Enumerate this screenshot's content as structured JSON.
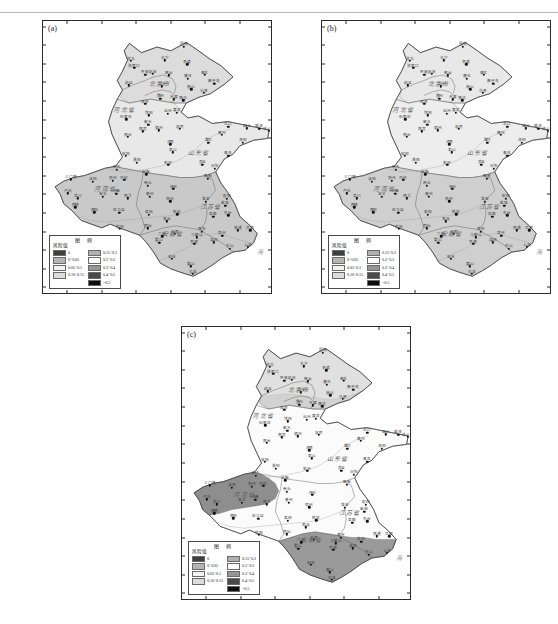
{
  "figure": {
    "caption_rule_text": "",
    "panels": [
      {
        "tag": "(a)",
        "id": "panel-a"
      },
      {
        "tag": "(b)",
        "id": "panel-b"
      },
      {
        "tag": "(c)",
        "id": "panel-c"
      }
    ]
  },
  "axes": {
    "y_ticks": [
      "43° N",
      "42°",
      "41°",
      "40°",
      "39°",
      "38°",
      "37°",
      "36°",
      "35°",
      "34°",
      "33°",
      "32°",
      "31°",
      "30°",
      "29°"
    ],
    "y_values": [
      43,
      42,
      41,
      40,
      39,
      38,
      37,
      36,
      35,
      34,
      33,
      32,
      31,
      30,
      29
    ],
    "x_ticks": [
      "111°",
      "113°",
      "115°",
      "117°",
      "119°",
      "121° E"
    ],
    "x_values": [
      111,
      113,
      115,
      117,
      119,
      121
    ],
    "x_range": [
      109.6,
      122.8
    ],
    "y_range": [
      28.7,
      43.3
    ],
    "x_label": "",
    "y_label": ""
  },
  "legend": {
    "title": "图  例",
    "subtitle": "风险值",
    "left_column": [
      {
        "label": "0",
        "color": "#3f3f3f"
      },
      {
        "label": "0~0.05",
        "color": "#b4b4b4"
      },
      {
        "label": "0.05~0.1",
        "color": "#f2f2f2"
      },
      {
        "label": "0.10~0.15",
        "color": "#dcdcdc"
      }
    ],
    "right_column": [
      {
        "label": "0.15~0.2",
        "color": "#b0b0b0"
      },
      {
        "label": "0.2~0.3",
        "color": "#fbfbfb"
      },
      {
        "label": "0.3~0.4",
        "color": "#969696"
      },
      {
        "label": "0.4~0.5",
        "color": "#4a4a4a"
      },
      {
        "label": ">0.5",
        "color": "#0d0d0d"
      }
    ]
  },
  "map": {
    "province_labels": [
      {
        "name": "北京市",
        "lon": 116.35,
        "lat": 39.95
      },
      {
        "name": "河北省",
        "lon": 114.3,
        "lat": 38.55
      },
      {
        "name": "山东省",
        "lon": 118.6,
        "lat": 36.25
      },
      {
        "name": "河南省",
        "lon": 113.2,
        "lat": 34.35
      },
      {
        "name": "江苏省",
        "lon": 119.3,
        "lat": 33.35
      },
      {
        "name": "安徽省",
        "lon": 117.1,
        "lat": 31.9
      }
    ],
    "sea_label": {
      "name": "海",
      "lon": 122.15,
      "lat": 30.95
    },
    "stations": [
      {
        "name": "张北",
        "lon": 114.7,
        "lat": 41.15
      },
      {
        "name": "张家口",
        "lon": 114.88,
        "lat": 40.78
      },
      {
        "name": "丰宁",
        "lon": 116.65,
        "lat": 41.2
      },
      {
        "name": "围场",
        "lon": 117.75,
        "lat": 41.93
      },
      {
        "name": "承德",
        "lon": 117.95,
        "lat": 40.98
      },
      {
        "name": "怀来",
        "lon": 115.52,
        "lat": 40.42
      },
      {
        "name": "蔚县",
        "lon": 114.57,
        "lat": 39.85
      },
      {
        "name": "延庆",
        "lon": 115.97,
        "lat": 40.45
      },
      {
        "name": "密云",
        "lon": 116.87,
        "lat": 40.38
      },
      {
        "name": "遵化",
        "lon": 117.97,
        "lat": 40.2
      },
      {
        "name": "青龙",
        "lon": 118.95,
        "lat": 40.4
      },
      {
        "name": "秦皇岛",
        "lon": 119.52,
        "lat": 39.93
      },
      {
        "name": "唐山",
        "lon": 118.18,
        "lat": 39.63
      },
      {
        "name": "乐亭",
        "lon": 118.9,
        "lat": 39.43
      },
      {
        "name": "北京",
        "lon": 116.47,
        "lat": 39.8
      },
      {
        "name": "天津",
        "lon": 117.17,
        "lat": 39.1
      },
      {
        "name": "保定",
        "lon": 115.52,
        "lat": 38.85
      },
      {
        "name": "霸州",
        "lon": 116.4,
        "lat": 39.12
      },
      {
        "name": "塘沽",
        "lon": 117.72,
        "lat": 39.05
      },
      {
        "name": "石家庄",
        "lon": 114.42,
        "lat": 38.03
      },
      {
        "name": "饶阳",
        "lon": 115.73,
        "lat": 38.23
      },
      {
        "name": "黄骅",
        "lon": 117.35,
        "lat": 38.37
      },
      {
        "name": "沧州",
        "lon": 116.83,
        "lat": 38.33
      },
      {
        "name": "南宫",
        "lon": 115.38,
        "lat": 37.37
      },
      {
        "name": "邢台",
        "lon": 114.5,
        "lat": 37.07
      },
      {
        "name": "衡水",
        "lon": 115.7,
        "lat": 37.73
      },
      {
        "name": "德州",
        "lon": 116.32,
        "lat": 37.43
      },
      {
        "name": "惠民",
        "lon": 117.53,
        "lat": 37.5
      },
      {
        "name": "龙口",
        "lon": 120.33,
        "lat": 37.62
      },
      {
        "name": "烟台",
        "lon": 121.4,
        "lat": 37.53
      },
      {
        "name": "威海",
        "lon": 122.12,
        "lat": 37.52
      },
      {
        "name": "成山头",
        "lon": 122.68,
        "lat": 37.4
      },
      {
        "name": "莱州",
        "lon": 119.95,
        "lat": 37.18
      },
      {
        "name": "潍坊",
        "lon": 119.18,
        "lat": 36.77
      },
      {
        "name": "青岛",
        "lon": 120.33,
        "lat": 36.07
      },
      {
        "name": "海阳",
        "lon": 121.17,
        "lat": 36.77
      },
      {
        "name": "济南",
        "lon": 116.98,
        "lat": 36.68
      },
      {
        "name": "泰山",
        "lon": 117.1,
        "lat": 36.25
      },
      {
        "name": "兖州",
        "lon": 116.85,
        "lat": 35.57
      },
      {
        "name": "莒县",
        "lon": 118.83,
        "lat": 35.58
      },
      {
        "name": "日照",
        "lon": 119.53,
        "lat": 35.38
      },
      {
        "name": "定陶",
        "lon": 115.57,
        "lat": 35.07
      },
      {
        "name": "安阳",
        "lon": 114.4,
        "lat": 36.05
      },
      {
        "name": "濮阳",
        "lon": 115.03,
        "lat": 35.7
      },
      {
        "name": "新乡",
        "lon": 113.88,
        "lat": 35.32
      },
      {
        "name": "三门峡",
        "lon": 111.2,
        "lat": 34.8
      },
      {
        "name": "洛阳",
        "lon": 112.47,
        "lat": 34.67
      },
      {
        "name": "郑州",
        "lon": 113.65,
        "lat": 34.72
      },
      {
        "name": "开封",
        "lon": 114.3,
        "lat": 34.77
      },
      {
        "name": "商丘",
        "lon": 115.67,
        "lat": 34.45
      },
      {
        "name": "卢氏",
        "lon": 111.05,
        "lat": 34.05
      },
      {
        "name": "栾川",
        "lon": 111.6,
        "lat": 33.78
      },
      {
        "name": "许昌",
        "lon": 113.85,
        "lat": 34.02
      },
      {
        "name": "西华",
        "lon": 114.52,
        "lat": 33.78
      },
      {
        "name": "宝丰",
        "lon": 113.05,
        "lat": 33.87
      },
      {
        "name": "西峡",
        "lon": 111.48,
        "lat": 33.3
      },
      {
        "name": "南阳",
        "lon": 112.58,
        "lat": 33.03
      },
      {
        "name": "驻马店",
        "lon": 114.02,
        "lat": 33.0
      },
      {
        "name": "固始",
        "lon": 115.67,
        "lat": 32.17
      },
      {
        "name": "信阳",
        "lon": 114.05,
        "lat": 32.13
      },
      {
        "name": "亳州",
        "lon": 115.77,
        "lat": 33.87
      },
      {
        "name": "阜阳",
        "lon": 115.73,
        "lat": 32.9
      },
      {
        "name": "宿州",
        "lon": 116.97,
        "lat": 33.63
      },
      {
        "name": "蚌埠",
        "lon": 117.38,
        "lat": 32.92
      },
      {
        "name": "寿县",
        "lon": 116.78,
        "lat": 32.55
      },
      {
        "name": "合肥",
        "lon": 117.23,
        "lat": 31.87
      },
      {
        "name": "六安",
        "lon": 116.5,
        "lat": 31.75
      },
      {
        "name": "霍山",
        "lon": 116.33,
        "lat": 31.4
      },
      {
        "name": "安庆",
        "lon": 117.05,
        "lat": 30.53
      },
      {
        "name": "黄山",
        "lon": 118.15,
        "lat": 30.13
      },
      {
        "name": "屯溪",
        "lon": 118.28,
        "lat": 29.72
      },
      {
        "name": "芜湖",
        "lon": 118.35,
        "lat": 31.33
      },
      {
        "name": "马鞍山",
        "lon": 118.5,
        "lat": 31.7
      },
      {
        "name": "徐州",
        "lon": 117.15,
        "lat": 34.28
      },
      {
        "name": "赣榆",
        "lon": 119.13,
        "lat": 34.83
      },
      {
        "name": "淮安",
        "lon": 119.03,
        "lat": 33.6
      },
      {
        "name": "射阳",
        "lon": 120.25,
        "lat": 33.77
      },
      {
        "name": "盐城",
        "lon": 120.15,
        "lat": 33.38
      },
      {
        "name": "东台",
        "lon": 120.32,
        "lat": 32.87
      },
      {
        "name": "高邮",
        "lon": 119.45,
        "lat": 32.8
      },
      {
        "name": "南京",
        "lon": 118.8,
        "lat": 32.0
      },
      {
        "name": "南通",
        "lon": 120.88,
        "lat": 32.07
      },
      {
        "name": "吕泗",
        "lon": 121.6,
        "lat": 32.07
      },
      {
        "name": "常州",
        "lon": 119.98,
        "lat": 31.78
      },
      {
        "name": "溧阳",
        "lon": 119.48,
        "lat": 31.43
      },
      {
        "name": "东山",
        "lon": 120.43,
        "lat": 31.07
      },
      {
        "name": "上海",
        "lon": 121.45,
        "lat": 31.17
      }
    ]
  },
  "panel_regions": {
    "a": [
      {
        "region": "north-hebei-beijing",
        "fill": "#dcdcdc"
      },
      {
        "region": "central-plain",
        "fill": "#f0f0f0"
      },
      {
        "region": "south-henan-anhui",
        "fill": "#c9c9c9"
      },
      {
        "region": "shandong-peninsula",
        "fill": "#e8e8e8"
      }
    ],
    "b": [
      {
        "region": "north-hebei-beijing",
        "fill": "#e8e8e8"
      },
      {
        "region": "central-plain",
        "fill": "#f4f4f4"
      },
      {
        "region": "south-henan-anhui",
        "fill": "#cfcfcf"
      },
      {
        "region": "shandong-peninsula",
        "fill": "#ededed"
      }
    ],
    "c": [
      {
        "region": "north-hebei-beijing",
        "fill": "#d2d2d2"
      },
      {
        "region": "central-plain",
        "fill": "#fbfbfb"
      },
      {
        "region": "west-henan",
        "fill": "#8e8e8e"
      },
      {
        "region": "south-anhui-jiangsu",
        "fill": "#9a9a9a"
      }
    ]
  }
}
